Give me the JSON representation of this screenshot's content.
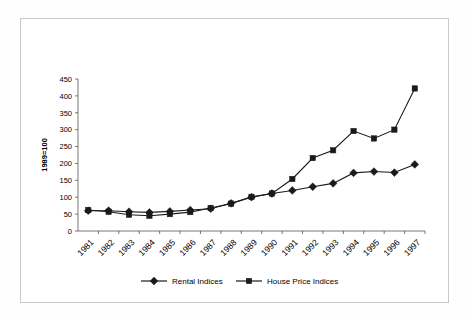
{
  "chart_data": {
    "type": "line",
    "title": "",
    "subtitle": "",
    "xlabel": "",
    "ylabel": "1989=100",
    "categories": [
      "1981",
      "1982",
      "1983",
      "1984",
      "1985",
      "1986",
      "1987",
      "1988",
      "1989",
      "1990",
      "1991",
      "1992",
      "1993",
      "1994",
      "1995",
      "1996",
      "1997"
    ],
    "x": [
      1981,
      1982,
      1983,
      1984,
      1985,
      1986,
      1987,
      1988,
      1989,
      1990,
      1991,
      1992,
      1993,
      1994,
      1995,
      1996,
      1997
    ],
    "series": [
      {
        "name": "Rental Indices",
        "marker": "diamond",
        "color": "#1a1a1a",
        "values": [
          60,
          60,
          57,
          55,
          58,
          62,
          66,
          82,
          100,
          111,
          120,
          131,
          141,
          172,
          176,
          173,
          197
        ]
      },
      {
        "name": "House Price Indices",
        "marker": "square",
        "color": "#1a1a1a",
        "values": [
          62,
          57,
          48,
          45,
          50,
          56,
          68,
          81,
          101,
          111,
          154,
          216,
          239,
          296,
          274,
          300,
          422
        ]
      }
    ],
    "ylim": [
      0,
      450
    ],
    "yticks": [
      0,
      50,
      100,
      150,
      200,
      250,
      300,
      350,
      400,
      450
    ],
    "ytick_labels": [
      "0",
      "50",
      "100",
      "150",
      "200",
      "250",
      "300",
      "350",
      "400",
      "450"
    ],
    "grid": false,
    "legend_position": "bottom",
    "xtick_rotation": -45
  },
  "legend": {
    "entries": [
      {
        "label": "Rental Indices",
        "marker": "diamond-icon"
      },
      {
        "label": "House Price Indices",
        "marker": "square-icon"
      }
    ]
  },
  "axes": {
    "y_title": "1989=100"
  }
}
